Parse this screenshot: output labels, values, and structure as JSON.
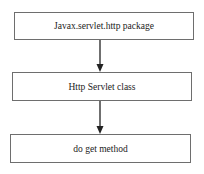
{
  "diagram": {
    "type": "flowchart",
    "direction": "top-to-bottom",
    "nodes": [
      {
        "id": "n1",
        "label": "Javax.servlet.http package"
      },
      {
        "id": "n2",
        "label": "Http Servlet class"
      },
      {
        "id": "n3",
        "label": "do get method"
      }
    ],
    "edges": [
      {
        "from": "n1",
        "to": "n2"
      },
      {
        "from": "n2",
        "to": "n3"
      }
    ],
    "colors": {
      "border": "#6e6e6e",
      "arrow": "#222222",
      "text": "#222222",
      "background": "#ffffff"
    }
  }
}
